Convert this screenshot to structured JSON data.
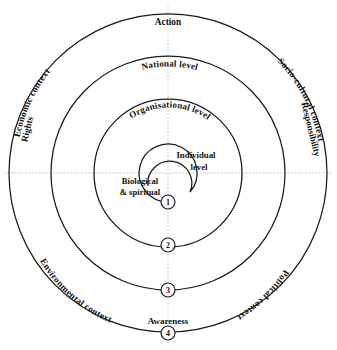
{
  "diagram": {
    "center": {
      "x": 168,
      "y": 173
    },
    "stroke_color": "#1a1a1a",
    "axis_color": "#b4b4b4",
    "background": "#ffffff",
    "rings": [
      {
        "id": "ring-individual",
        "radius": 29,
        "level_label": "Individual\nlevel"
      },
      {
        "id": "ring-organisational",
        "radius": 74,
        "level_label": "Organisational level"
      },
      {
        "id": "ring-national",
        "radius": 117,
        "level_label": "National level"
      },
      {
        "id": "ring-outer",
        "radius": 159,
        "level_label": ""
      }
    ],
    "level_labels": {
      "individual_line1": "Individual",
      "individual_line2": "level",
      "biological_line1": "Biological",
      "biological_line2": "& spiritual",
      "organisational": "Organisational level",
      "national": "National level"
    },
    "axis_labels": {
      "top": "Action",
      "bottom": "Awareness",
      "left": "Rights",
      "right": "Responsibility"
    },
    "context_labels": {
      "upper_left": "Economic context",
      "upper_right": "Socio-cultural  context",
      "lower_left": "Environmental context",
      "lower_right": "Political context"
    },
    "markers": [
      {
        "label": "1",
        "x": 168,
        "y": 202
      },
      {
        "label": "2",
        "x": 168,
        "y": 245
      },
      {
        "label": "3",
        "x": 168,
        "y": 290
      },
      {
        "label": "4",
        "x": 168,
        "y": 333
      }
    ]
  }
}
